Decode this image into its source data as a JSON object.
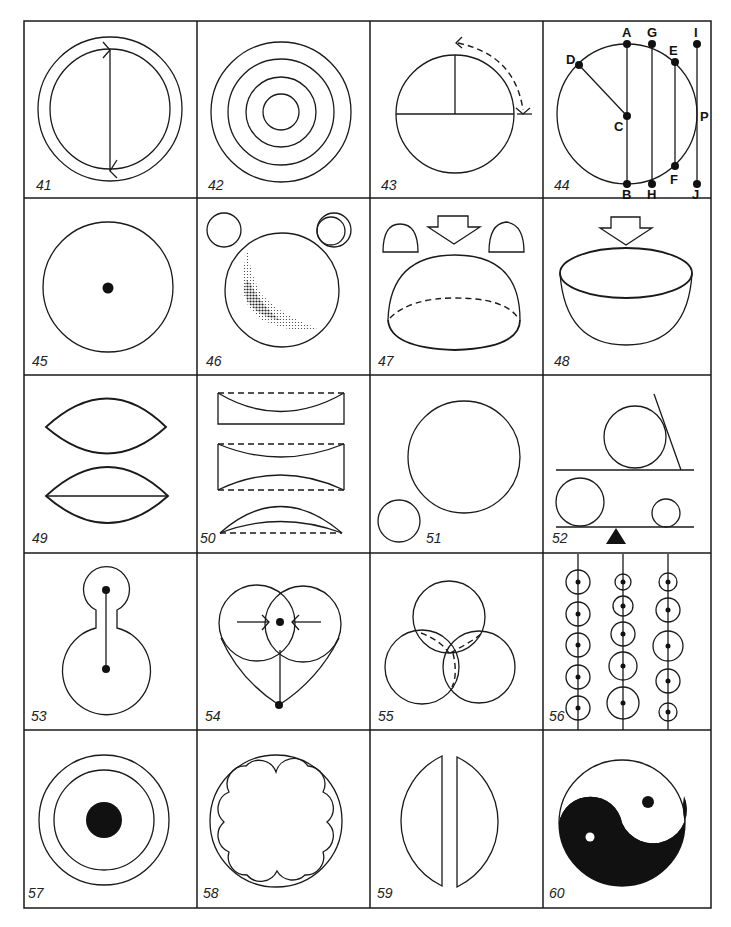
{
  "page": {
    "grid": {
      "columns": 4,
      "rows": 5
    }
  },
  "figures": [
    {
      "number": "41",
      "description": "Two concentric circles with a vertical chord between arrowheads"
    },
    {
      "number": "42",
      "description": "Four concentric circles"
    },
    {
      "number": "43",
      "description": "Circle with horizontal diameter, vertical radius and dashed rotation arrow"
    },
    {
      "number": "44",
      "description": "Circle with labeled points and chords",
      "points": [
        "A",
        "G",
        "E",
        "I",
        "D",
        "C",
        "P",
        "F",
        "B",
        "H",
        "J"
      ]
    },
    {
      "number": "45",
      "description": "Circle with central dot"
    },
    {
      "number": "46",
      "description": "Circle with shaded crescent and two small circles"
    },
    {
      "number": "47",
      "description": "Dome (hemisphere) with dashed base and arrow above"
    },
    {
      "number": "48",
      "description": "Bowl (hemisphere) with arrow above"
    },
    {
      "number": "49",
      "description": "Two lens shapes, lower with horizontal line"
    },
    {
      "number": "50",
      "description": "Three lens cross-sections with dashed lines"
    },
    {
      "number": "51",
      "description": "Large circle and small circle"
    },
    {
      "number": "52",
      "description": "Circles on lines, with tangent line and fulcrum"
    },
    {
      "number": "53",
      "description": "Keyhole shape with two dots connected"
    },
    {
      "number": "54",
      "description": "Heart from two overlapping circles with arrows"
    },
    {
      "number": "55",
      "description": "Three overlapping circles with dashed hidden arcs"
    },
    {
      "number": "56",
      "description": "Three vertical lines with circles of varying size"
    },
    {
      "number": "57",
      "description": "Two concentric circles with filled center disk"
    },
    {
      "number": "58",
      "description": "Circle containing eight-lobed flower shape"
    },
    {
      "number": "59",
      "description": "Circle split into two separated halves"
    },
    {
      "number": "60",
      "description": "Yin-yang symbol"
    }
  ],
  "fig44_labels": {
    "A": "A",
    "G": "G",
    "E": "E",
    "I": "I",
    "D": "D",
    "C": "C",
    "P": "P",
    "F": "F",
    "B": "B",
    "H": "H",
    "J": "J"
  }
}
